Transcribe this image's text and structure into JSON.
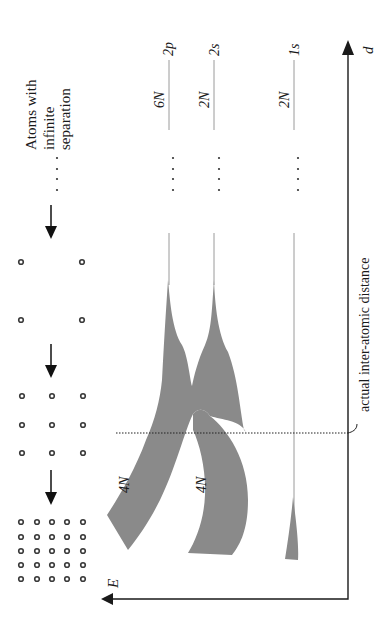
{
  "title_label": {
    "line1": "Atoms with",
    "line2": "infinite",
    "line3": "separation"
  },
  "axes": {
    "energy_label": "E",
    "distance_label": "d"
  },
  "annotation": {
    "actual_distance": "actual inter-atomic distance"
  },
  "levels": [
    {
      "name": "2p",
      "degeneracy": "6N",
      "band_label": "4N"
    },
    {
      "name": "2s",
      "degeneracy": "2N",
      "band_label": "4N"
    },
    {
      "name": "1s",
      "degeneracy": "2N",
      "band_label": ""
    }
  ],
  "atom_configurations": [
    {
      "label": "infinite separation",
      "grid": "dots"
    },
    {
      "label": "2x2",
      "grid": "2x2"
    },
    {
      "label": "3x3",
      "grid": "3x3"
    },
    {
      "label": "5x5",
      "grid": "5x5"
    }
  ],
  "colors": {
    "band_fill": "#8a8a8a",
    "level_line": "#9a9a9a",
    "axis": "#1a1a1a"
  }
}
